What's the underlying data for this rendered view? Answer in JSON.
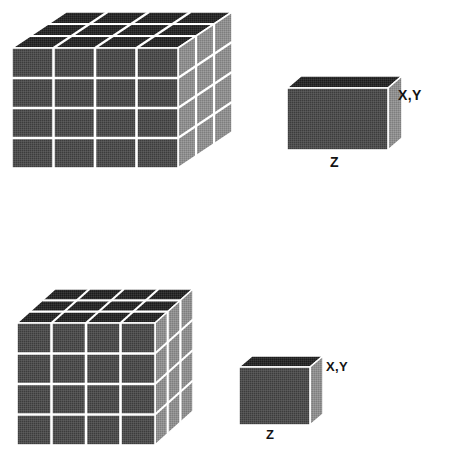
{
  "figure": {
    "background_color": "#ffffff",
    "grid_line_color": "#ffffff",
    "front_face_color": "#4a4a4a",
    "side_face_color": "#8c8c8c",
    "top_face_color": "#262626",
    "label_color": "#141414"
  },
  "panels": [
    {
      "id": "top",
      "name": "anisotropic-voxel-panel",
      "block": {
        "name": "voxel-block-anisotropic",
        "columns": 4,
        "rows": 4,
        "depth": 3
      },
      "unit_cell": {
        "name": "unit-voxel-anisotropic",
        "label_xy": "X,Y",
        "label_z": "Z"
      }
    },
    {
      "id": "bottom",
      "name": "isotropic-voxel-panel",
      "block": {
        "name": "voxel-block-isotropic",
        "columns": 4,
        "rows": 4,
        "depth": 3
      },
      "unit_cell": {
        "name": "unit-voxel-isotropic",
        "label_xy": "X,Y",
        "label_z": "Z"
      }
    }
  ],
  "labels": {
    "top_xy": "X,Y",
    "top_z": "Z",
    "bottom_xy": "X,Y",
    "bottom_z": "Z"
  }
}
